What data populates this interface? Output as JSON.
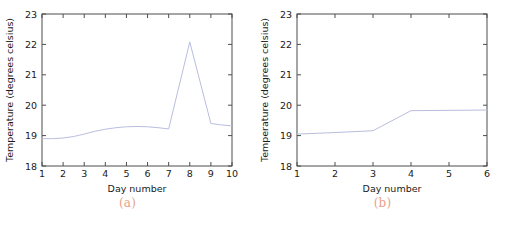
{
  "figure": {
    "panels": [
      {
        "caption": "(a)",
        "chart_data": {
          "type": "line",
          "title": "",
          "xlabel": "Day number",
          "ylabel": "Temperature (degrees celsius)",
          "xlim": [
            1,
            10
          ],
          "ylim": [
            18,
            23
          ],
          "xticks": [
            "1",
            "2",
            "3",
            "4",
            "5",
            "6",
            "7",
            "8",
            "9",
            "10"
          ],
          "yticks": [
            "18",
            "19",
            "20",
            "21",
            "22",
            "23"
          ],
          "grid": false,
          "legend": "none",
          "x": [
            1,
            1.5,
            2,
            2.5,
            3,
            3.5,
            4,
            4.5,
            5,
            5.5,
            6,
            6.5,
            7,
            8,
            9,
            9.5,
            10
          ],
          "y": [
            18.9,
            18.9,
            18.92,
            18.97,
            19.05,
            19.14,
            19.21,
            19.26,
            19.29,
            19.3,
            19.29,
            19.26,
            19.22,
            22.08,
            19.4,
            19.35,
            19.32
          ],
          "series": [
            {
              "name": "Temperature",
              "color": "#b9bede",
              "values": [
                18.9,
                18.9,
                18.92,
                18.97,
                19.05,
                19.14,
                19.21,
                19.26,
                19.29,
                19.3,
                19.29,
                19.26,
                19.22,
                22.08,
                19.4,
                19.35,
                19.32
              ]
            }
          ]
        }
      },
      {
        "caption": "(b)",
        "chart_data": {
          "type": "line",
          "title": "",
          "xlabel": "Day number",
          "ylabel": "Temperature (degrees celsius)",
          "xlim": [
            1,
            6
          ],
          "ylim": [
            18,
            23
          ],
          "xticks": [
            "1",
            "2",
            "3",
            "4",
            "5",
            "6"
          ],
          "yticks": [
            "18",
            "19",
            "20",
            "21",
            "22",
            "23"
          ],
          "grid": false,
          "legend": "none",
          "x": [
            1,
            2,
            3,
            4,
            5,
            6
          ],
          "y": [
            19.05,
            19.1,
            19.16,
            19.82,
            19.83,
            19.84
          ],
          "series": [
            {
              "name": "Temperature",
              "color": "#b9bede",
              "values": [
                19.05,
                19.1,
                19.16,
                19.82,
                19.83,
                19.84
              ]
            }
          ]
        }
      }
    ]
  }
}
